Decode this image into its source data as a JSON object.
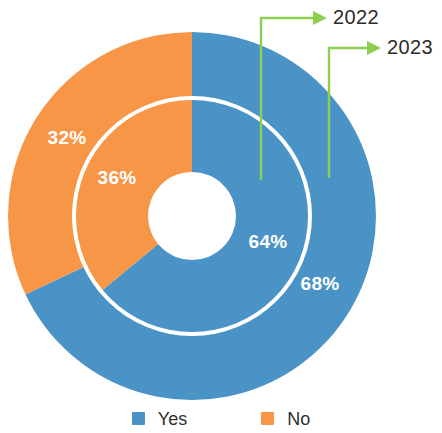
{
  "chart_data": {
    "type": "pie",
    "variant": "nested-donut",
    "title": "",
    "subtitle": "",
    "xlabel": "",
    "ylabel": "",
    "grid": false,
    "legend_position": "bottom",
    "categories": [
      "Yes",
      "No"
    ],
    "colors": {
      "yes": "#4A93C6",
      "no": "#F79647",
      "callout": "#8DD04F",
      "label_text": "#FFFFFF",
      "callout_text": "#2B2B2B",
      "background": "#FFFFFF",
      "ring_gap": "#FFFFFF"
    },
    "rings": [
      {
        "name": "2023",
        "position": "outer",
        "slices": [
          {
            "label": "Yes",
            "value": 68,
            "display": "68%",
            "color": "#4A93C6"
          },
          {
            "label": "No",
            "value": 32,
            "display": "32%",
            "color": "#F79647"
          }
        ]
      },
      {
        "name": "2022",
        "position": "inner",
        "slices": [
          {
            "label": "Yes",
            "value": 64,
            "display": "64%",
            "color": "#4A93C6"
          },
          {
            "label": "No",
            "value": 36,
            "display": "36%",
            "color": "#F79647"
          }
        ]
      }
    ],
    "series": [
      {
        "name": "2022",
        "values": [
          64,
          36
        ]
      },
      {
        "name": "2023",
        "values": [
          68,
          32
        ]
      }
    ],
    "data_labels": [
      "32%",
      "36%",
      "64%",
      "68%"
    ],
    "annotations": [
      {
        "text": "2022",
        "points_to": "inner ring (2022)"
      },
      {
        "text": "2023",
        "points_to": "outer ring (2023)"
      }
    ]
  },
  "callouts": {
    "year_2022": "2022",
    "year_2023": "2023"
  },
  "slice_labels": {
    "outer_no": "32%",
    "inner_no": "36%",
    "inner_yes": "64%",
    "outer_yes": "68%"
  },
  "legend": {
    "items": [
      {
        "label": "Yes",
        "color": "#4A93C6"
      },
      {
        "label": "No",
        "color": "#F79647"
      }
    ]
  }
}
